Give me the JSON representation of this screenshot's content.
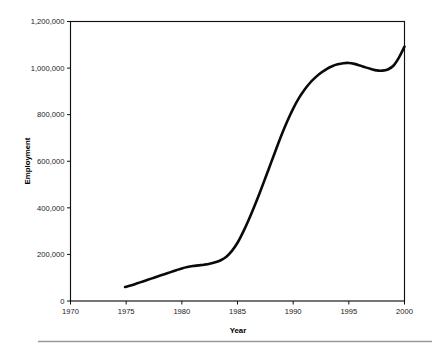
{
  "chart_data": {
    "type": "line",
    "title": "",
    "xlabel": "Year",
    "ylabel": "Employment",
    "xlim": [
      1970,
      2000
    ],
    "ylim": [
      0,
      1200000
    ],
    "grid": false,
    "legend": null,
    "x_ticks": [
      1970,
      1975,
      1980,
      1985,
      1990,
      1995,
      2000
    ],
    "x_tick_labels": [
      "1970",
      "1975",
      "1980",
      "1985",
      "1990",
      "1995",
      "2000"
    ],
    "y_ticks": [
      0,
      200000,
      400000,
      600000,
      800000,
      1000000,
      1200000
    ],
    "y_tick_labels": [
      "0",
      "200,000",
      "400,000",
      "600,000",
      "800,000",
      "1,000,000",
      "1,200,000"
    ],
    "series": [
      {
        "name": "Employment",
        "color": "#0a0a0a",
        "x": [
          1974.9,
          1975.5,
          1976.0,
          1976.5,
          1977.0,
          1977.5,
          1978.0,
          1978.5,
          1979.0,
          1979.5,
          1980.0,
          1980.5,
          1981.0,
          1981.5,
          1982.0,
          1982.5,
          1983.0,
          1983.5,
          1984.0,
          1984.5,
          1985.0,
          1985.5,
          1986.0,
          1986.5,
          1987.0,
          1987.5,
          1988.0,
          1988.5,
          1989.0,
          1989.5,
          1990.0,
          1990.5,
          1991.0,
          1991.5,
          1992.0,
          1992.5,
          1993.0,
          1993.5,
          1994.0,
          1994.5,
          1995.0,
          1995.5,
          1996.0,
          1996.5,
          1997.0,
          1997.5,
          1998.0,
          1998.5,
          1999.0,
          1999.5,
          2000.0
        ],
        "y": [
          60000,
          68000,
          76000,
          84000,
          92000,
          100000,
          108000,
          116000,
          124000,
          132000,
          140000,
          146000,
          150000,
          153000,
          156000,
          160000,
          166000,
          175000,
          190000,
          215000,
          250000,
          296000,
          348000,
          405000,
          465000,
          528000,
          592000,
          656000,
          718000,
          775000,
          826000,
          870000,
          906000,
          936000,
          960000,
          980000,
          996000,
          1008000,
          1016000,
          1021000,
          1022000,
          1018000,
          1011000,
          1003000,
          996000,
          990000,
          989000,
          994000,
          1010000,
          1045000,
          1092000
        ]
      }
    ]
  },
  "axis": {
    "y_label": "Employment",
    "x_label": "Year"
  }
}
